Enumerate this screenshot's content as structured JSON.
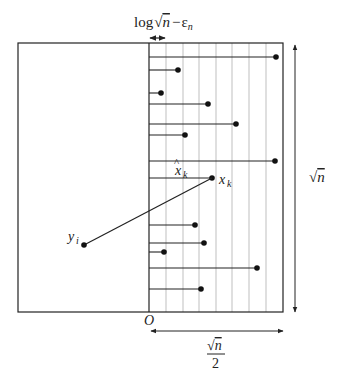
{
  "figure": {
    "labels": {
      "top_width": "log√n − ε_n",
      "top_width_parts": {
        "pre": "log",
        "radical": "n",
        "minus": "−",
        "eps": "ε",
        "eps_sub": "n"
      },
      "height": "√n",
      "width": "√n / 2",
      "width_num": "n",
      "width_den": "2",
      "origin": "O",
      "x_hat": "x̂_k",
      "x_hat_base": "x",
      "x_hat_sub": "k",
      "x_k": "x_k",
      "x_k_base": "x",
      "x_k_sub": "k",
      "y_i": "y_i",
      "y_i_base": "y",
      "y_i_sub": "i"
    },
    "colors": {
      "stroke": "#222222",
      "grid": "#b8b8b8",
      "background": "#ffffff"
    },
    "outer_box": {
      "x1": 18,
      "y1": 43,
      "x2": 283,
      "y2": 312
    },
    "origin_x": 149,
    "strip_lines_x": [
      166,
      183,
      199,
      216,
      232,
      249,
      266
    ],
    "rows": [
      {
        "y": 57,
        "dot_x": 276
      },
      {
        "y": 70,
        "dot_x": 178
      },
      {
        "y": 93,
        "dot_x": 161
      },
      {
        "y": 104,
        "dot_x": 208
      },
      {
        "y": 124,
        "dot_x": 236
      },
      {
        "y": 135,
        "dot_x": 185
      },
      {
        "y": 161,
        "dot_x": 275
      },
      {
        "y": 178,
        "dot_x": 212,
        "is_xk": true
      },
      {
        "y": 225,
        "dot_x": 195
      },
      {
        "y": 243,
        "dot_x": 204
      },
      {
        "y": 252,
        "dot_x": 164
      },
      {
        "y": 268,
        "dot_x": 257
      },
      {
        "y": 289,
        "dot_x": 201
      }
    ],
    "y_i_point": {
      "x": 84,
      "y": 245
    }
  }
}
